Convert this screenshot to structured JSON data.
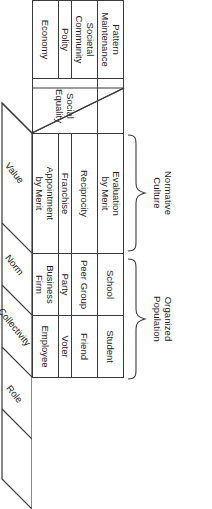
{
  "figure": {
    "orientation": "rotated-90-clockwise",
    "line_color": "#3a3a3a",
    "background_color": "#ffffff"
  },
  "braces": [
    {
      "label": "Normative\nCulture",
      "name": "normative-culture"
    },
    {
      "label": "Organized\nPopulation",
      "name": "organized-population"
    }
  ],
  "matrix": {
    "row_labels": [
      "Economy",
      "Polity",
      "Societal\nCommunity",
      "Pattern\nMaintenance"
    ],
    "merged_norm_cell": "Social Equality",
    "rows": [
      {
        "subsystem": "Economy",
        "norm": "Social Equality",
        "collectivity_value": "Appointment\nby Merit",
        "collectivity": "Business Firm",
        "role": "Employee"
      },
      {
        "subsystem": "Polity",
        "norm": "Social Equality",
        "collectivity_value": "Franchise",
        "collectivity": "Party",
        "role": "Voter"
      },
      {
        "subsystem": "Societal\nCommunity",
        "norm": "Social Equality",
        "collectivity_value": "Reciprocity",
        "collectivity": "Peer Group",
        "role": "Friend"
      },
      {
        "subsystem": "Pattern\nMaintenance",
        "norm": "",
        "collectivity_value": "Evaluation\nby Merit",
        "collectivity": "School",
        "role": "Student"
      }
    ]
  },
  "axis_labels": [
    {
      "label": "Value",
      "name": "value"
    },
    {
      "label": "Norm",
      "name": "norm"
    },
    {
      "label": "Collectivity",
      "name": "collectivity"
    },
    {
      "label": "Role",
      "name": "role"
    }
  ]
}
